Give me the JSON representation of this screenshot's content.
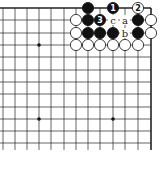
{
  "board": {
    "x_lines": [
      3,
      15,
      27,
      39,
      51,
      64,
      76,
      88,
      100,
      113,
      125,
      138,
      151
    ],
    "y_lines": [
      8,
      20,
      33,
      45,
      57,
      70,
      82,
      94,
      107,
      119,
      131,
      143
    ],
    "right_edge_x": 151,
    "top_edge_y": 8,
    "hoshi": [
      [
        39,
        45
      ],
      [
        39,
        119
      ],
      [
        113,
        119
      ]
    ],
    "stones": [
      {
        "color": "black",
        "x": 88,
        "y": 8,
        "label": ""
      },
      {
        "color": "black",
        "x": 113,
        "y": 8,
        "label": "1"
      },
      {
        "color": "white",
        "x": 138,
        "y": 8,
        "label": "2"
      },
      {
        "color": "white",
        "x": 76,
        "y": 20,
        "label": ""
      },
      {
        "color": "black",
        "x": 88,
        "y": 20,
        "label": ""
      },
      {
        "color": "black",
        "x": 100,
        "y": 20,
        "label": "3"
      },
      {
        "color": "black",
        "x": 138,
        "y": 20,
        "label": ""
      },
      {
        "color": "white",
        "x": 151,
        "y": 20,
        "label": ""
      },
      {
        "color": "white",
        "x": 76,
        "y": 33,
        "label": ""
      },
      {
        "color": "black",
        "x": 88,
        "y": 33,
        "label": ""
      },
      {
        "color": "black",
        "x": 100,
        "y": 33,
        "label": ""
      },
      {
        "color": "black",
        "x": 113,
        "y": 33,
        "label": ""
      },
      {
        "color": "black",
        "x": 138,
        "y": 33,
        "label": ""
      },
      {
        "color": "white",
        "x": 151,
        "y": 33,
        "label": ""
      },
      {
        "color": "white",
        "x": 76,
        "y": 45,
        "label": ""
      },
      {
        "color": "white",
        "x": 88,
        "y": 45,
        "label": ""
      },
      {
        "color": "white",
        "x": 100,
        "y": 45,
        "label": ""
      },
      {
        "color": "white",
        "x": 113,
        "y": 45,
        "label": ""
      },
      {
        "color": "white",
        "x": 125,
        "y": 45,
        "label": ""
      },
      {
        "color": "white",
        "x": 138,
        "y": 45,
        "label": ""
      }
    ],
    "letters": [
      {
        "text": "c",
        "x": 113,
        "y": 20
      },
      {
        "text": "a",
        "x": 125,
        "y": 20
      },
      {
        "text": "b",
        "x": 125,
        "y": 33
      }
    ]
  }
}
